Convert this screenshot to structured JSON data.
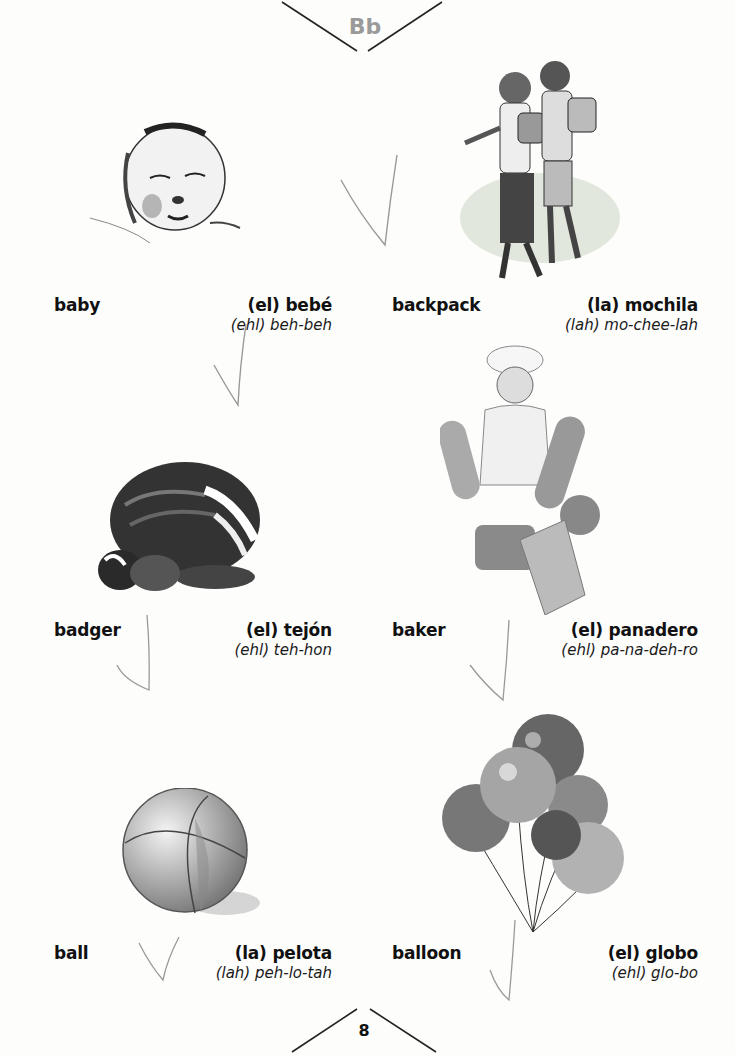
{
  "header": {
    "letter": "Bb"
  },
  "footer": {
    "page_number": "8"
  },
  "entries": [
    {
      "english": "baby",
      "spanish": "(el) bebé",
      "pronunciation": "(ehl) beh-beh",
      "illustration": "sleeping-baby"
    },
    {
      "english": "backpack",
      "spanish": "(la) mochila",
      "pronunciation": "(lah) mo-chee-lah",
      "illustration": "two-children-with-backpacks"
    },
    {
      "english": "badger",
      "spanish": "(el) tejón",
      "pronunciation": "(ehl) teh-hon",
      "illustration": "badger-with-cub"
    },
    {
      "english": "baker",
      "spanish": "(el) panadero",
      "pronunciation": "(ehl) pa-na-deh-ro",
      "illustration": "baker-with-bread"
    },
    {
      "english": "ball",
      "spanish": "(la) pelota",
      "pronunciation": "(lah) peh-lo-tah",
      "illustration": "beach-ball"
    },
    {
      "english": "balloon",
      "spanish": "(el) globo",
      "pronunciation": "(ehl) glo-bo",
      "illustration": "bunch-of-balloons"
    }
  ],
  "colors": {
    "heading_gray": "#9a9a9a",
    "text": "#111111",
    "check_marks": "#9a9a9a"
  }
}
